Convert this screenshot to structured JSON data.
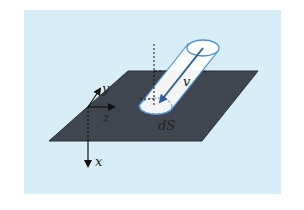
{
  "figure": {
    "background_color": "#d7eef8",
    "plane_color": "#3f4650",
    "tube_color": "#ffffff",
    "tube_outline_color": "#4a90d9",
    "vector_color": "#3a6ea8",
    "axis_color": "#111111"
  },
  "labels": {
    "y_axis": "y",
    "z_axis": "z",
    "x_axis": "x",
    "velocity": "v",
    "surface_element": "dS"
  }
}
